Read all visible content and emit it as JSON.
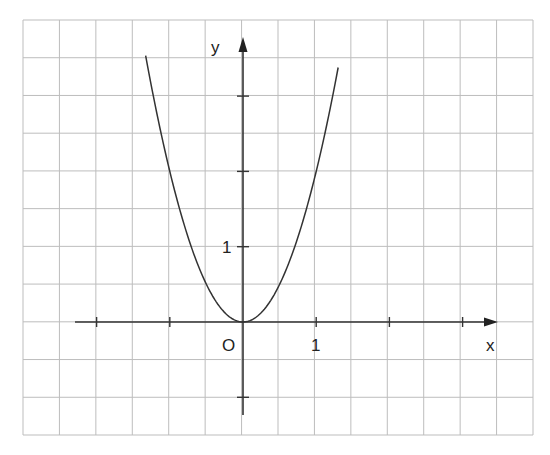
{
  "chart_data": {
    "type": "line",
    "title": "",
    "function": "y = 2x^2",
    "xlabel": "x",
    "ylabel": "y",
    "origin_label": "O",
    "x_tick_labels": [
      {
        "value": 1,
        "label": "1"
      }
    ],
    "y_tick_labels": [
      {
        "value": 1,
        "label": "1"
      }
    ],
    "x_ticks": [
      -2,
      -1,
      1,
      2,
      3
    ],
    "y_ticks": [
      -1,
      1,
      2,
      3
    ],
    "xlim": [
      -2.3,
      3.6
    ],
    "ylim": [
      -1.2,
      3.8
    ],
    "grid": true,
    "grid_cell_units": 0.5,
    "series": [
      {
        "name": "parabola",
        "x": [
          -1.33,
          -1.2,
          -1.0,
          -0.8,
          -0.6,
          -0.5,
          -0.4,
          -0.2,
          0,
          0.2,
          0.4,
          0.5,
          0.6,
          0.8,
          1.0,
          1.2,
          1.3
        ],
        "y": [
          3.54,
          2.88,
          2.0,
          1.28,
          0.72,
          0.5,
          0.32,
          0.08,
          0,
          0.08,
          0.32,
          0.5,
          0.72,
          1.28,
          2.0,
          2.88,
          3.38
        ]
      }
    ],
    "legend": null
  },
  "colors": {
    "grid": "#bdbdbd",
    "axis": "#333333",
    "curve": "#333333",
    "background": "#ffffff"
  }
}
